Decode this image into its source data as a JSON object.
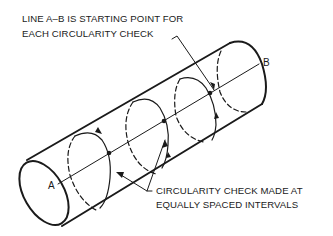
{
  "diagram": {
    "callout_top": {
      "line1": "LINE A–B IS STARTING POINT FOR",
      "line2": "EACH CIRCULARITY CHECK"
    },
    "callout_bottom": {
      "line1": "CIRCULARITY CHECK MADE AT",
      "line2": "EQUALLY SPACED INTERVALS"
    },
    "point_a": "A",
    "point_b": "B",
    "colors": {
      "ink": "#1a1a1a",
      "background": "#ffffff"
    }
  }
}
